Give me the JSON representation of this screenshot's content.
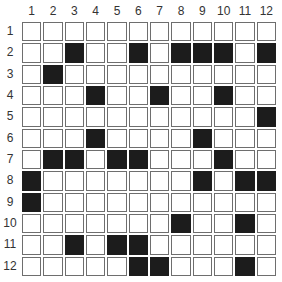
{
  "grid": {
    "rows": 12,
    "cols": 12,
    "column_labels": [
      "1",
      "2",
      "3",
      "4",
      "5",
      "6",
      "7",
      "8",
      "9",
      "10",
      "11",
      "12"
    ],
    "row_labels": [
      "1",
      "2",
      "3",
      "4",
      "5",
      "6",
      "7",
      "8",
      "9",
      "10",
      "11",
      "12"
    ],
    "filled_cells": {
      "1": [],
      "2": [
        3,
        6,
        8,
        9,
        10,
        12
      ],
      "3": [
        2
      ],
      "4": [
        4,
        7,
        10
      ],
      "5": [
        12
      ],
      "6": [
        4,
        9
      ],
      "7": [
        2,
        3,
        5,
        6,
        10
      ],
      "8": [
        1,
        9,
        11,
        12
      ],
      "9": [
        1
      ],
      "10": [
        8,
        11
      ],
      "11": [
        3,
        5,
        6
      ],
      "12": [
        6,
        7,
        11
      ]
    },
    "colors": {
      "filled": "#1c1c1c",
      "empty": "#ffffff",
      "border": "#6e6e6e",
      "label": "#333333"
    }
  }
}
